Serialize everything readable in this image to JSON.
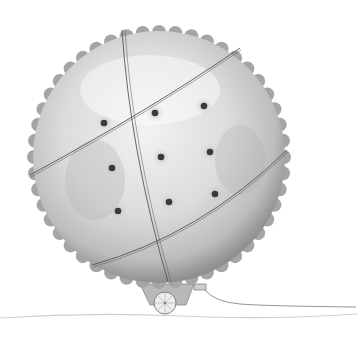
{
  "illustration": {
    "subject": "giant cracker tied with string on a small wheeled cart",
    "caption": "Illustration: a giant round cracker strapped onto a tiny cart",
    "colors": {
      "background": "#ffffff",
      "cracker_fill": "#d9d9d9",
      "cracker_light": "#efefef",
      "cracker_edge": "#8a8a8a",
      "dot": "#3a3a3a",
      "string": "#555555",
      "cart": "#9a9a9a",
      "ground": "#c8c8c8"
    },
    "cracker": {
      "cx": 159,
      "cy": 157,
      "r": 126
    },
    "dots": [
      {
        "x": 104,
        "y": 123
      },
      {
        "x": 155,
        "y": 113
      },
      {
        "x": 204,
        "y": 106
      },
      {
        "x": 112,
        "y": 168
      },
      {
        "x": 161,
        "y": 157
      },
      {
        "x": 210,
        "y": 152
      },
      {
        "x": 118,
        "y": 211
      },
      {
        "x": 169,
        "y": 202
      },
      {
        "x": 215,
        "y": 194
      }
    ]
  }
}
